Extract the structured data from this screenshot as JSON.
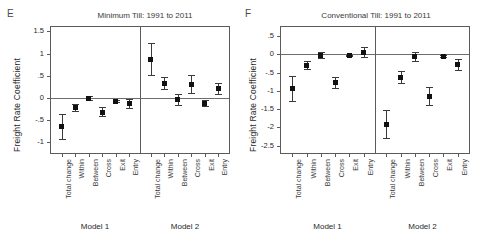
{
  "figure": {
    "background": "#ffffff",
    "marker_color": "#111111",
    "axis_color": "#5b5b5b"
  },
  "panels": [
    {
      "letter": "E",
      "title": "Minimum Till: 1991 to 2011",
      "ylabel": "Freight Rate Coefficient",
      "model_captions": [
        "Model 1",
        "Model 2"
      ]
    },
    {
      "letter": "F",
      "title": "Conventional Till: 1991 to 2011",
      "ylabel": "Freight Rate Coefficient",
      "model_captions": [
        "Model 1",
        "Model 2"
      ]
    }
  ],
  "chart_data": [
    {
      "type": "scatter",
      "panel_letter": "E",
      "title": "Minimum Till: 1991 to 2011",
      "xlabel": "",
      "ylabel": "Freight Rate Coefficient",
      "ylim": [
        -1.25,
        1.6
      ],
      "yticks": [
        1.5,
        1,
        0.5,
        0,
        -0.5,
        -1
      ],
      "ytick_labels": [
        "1.5",
        "1",
        ".5",
        "0",
        "-.5",
        "-1"
      ],
      "grid": false,
      "legend": "none",
      "zero_reference_line": 0,
      "categories": [
        "Total change",
        "Within",
        "Between",
        "Cross",
        "Exit",
        "Entry"
      ],
      "groups": [
        {
          "name": "Model 1",
          "values": [
            -0.66,
            -0.23,
            -0.02,
            -0.33,
            -0.08,
            -0.13
          ],
          "ci_low": [
            -0.95,
            -0.33,
            -0.08,
            -0.44,
            -0.11,
            -0.25
          ],
          "ci_high": [
            -0.37,
            -0.14,
            0.04,
            -0.22,
            -0.05,
            -0.02
          ]
        },
        {
          "name": "Model 2",
          "values": [
            0.87,
            0.33,
            -0.04,
            0.31,
            -0.13,
            0.2
          ],
          "ci_low": [
            0.5,
            0.18,
            -0.18,
            0.09,
            -0.2,
            0.07
          ],
          "ci_high": [
            1.24,
            0.48,
            0.08,
            0.51,
            -0.06,
            0.33
          ]
        }
      ]
    },
    {
      "type": "scatter",
      "panel_letter": "F",
      "title": "Conventional Till: 1991 to 2011",
      "xlabel": "",
      "ylabel": "Freight Rate Coefficient",
      "ylim": [
        -2.7,
        0.75
      ],
      "yticks": [
        0.5,
        0,
        -0.5,
        -1,
        -1.5,
        -2,
        -2.5
      ],
      "ytick_labels": [
        ".5",
        "0",
        "-.5",
        "-1",
        "-1.5",
        "-2",
        "-2.5"
      ],
      "grid": false,
      "legend": "none",
      "zero_reference_line": 0,
      "categories": [
        "Total change",
        "Within",
        "Between",
        "Cross",
        "Exit",
        "Entry"
      ],
      "groups": [
        {
          "name": "Model 1",
          "values": [
            -0.94,
            -0.3,
            -0.04,
            -0.78,
            -0.04,
            0.05
          ],
          "ci_low": [
            -1.3,
            -0.43,
            -0.14,
            -0.94,
            -0.07,
            -0.1
          ],
          "ci_high": [
            -0.6,
            -0.17,
            0.07,
            -0.62,
            -0.01,
            0.2
          ]
        },
        {
          "name": "Model 2",
          "values": [
            -1.93,
            -0.63,
            -0.07,
            -1.14,
            -0.07,
            -0.29
          ],
          "ci_low": [
            -2.33,
            -0.8,
            -0.2,
            -1.4,
            -0.11,
            -0.45
          ],
          "ci_high": [
            -1.53,
            -0.46,
            0.06,
            -0.88,
            -0.03,
            -0.13
          ]
        }
      ]
    }
  ]
}
